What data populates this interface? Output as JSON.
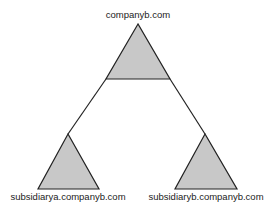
{
  "diagram": {
    "type": "domain-tree",
    "colors": {
      "fill": "#c8c8c8",
      "stroke": "#222222"
    },
    "root": {
      "label": "companyb.com"
    },
    "children": [
      {
        "label": "subsidiarya.companyb.com"
      },
      {
        "label": "subsidiaryb.companyb.com"
      }
    ]
  }
}
